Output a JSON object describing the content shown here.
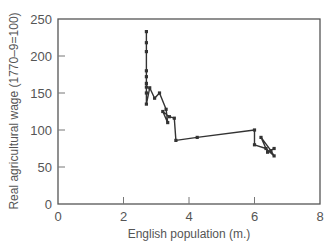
{
  "chart_data": {
    "type": "line",
    "title": "",
    "xlabel": "English population (m.)",
    "ylabel": "Real agricultural wage (1770–9=100)",
    "xlim": [
      0,
      8
    ],
    "ylim": [
      0,
      250
    ],
    "xticks": [
      0,
      2,
      4,
      6,
      8
    ],
    "yticks": [
      0,
      50,
      100,
      150,
      200,
      250
    ],
    "grid": false,
    "legend": null,
    "series": [
      {
        "name": "Wage vs population (time path)",
        "x": [
          2.7,
          2.7,
          2.7,
          2.7,
          2.7,
          2.7,
          2.7,
          2.7,
          2.7,
          2.8,
          2.95,
          3.1,
          3.3,
          3.35,
          3.2,
          3.4,
          3.55,
          3.6,
          4.25,
          6.0,
          6.0,
          6.35,
          6.6,
          6.5,
          6.2,
          6.4,
          6.6
        ],
        "y": [
          233,
          218,
          206,
          180,
          172,
          163,
          158,
          150,
          135,
          157,
          143,
          150,
          128,
          110,
          125,
          118,
          116,
          86,
          90,
          100,
          80,
          75,
          65,
          72,
          90,
          70,
          75
        ]
      }
    ]
  },
  "axes": {
    "x_title": "English population (m.)",
    "y_title": "Real agricultural wage (1770–9=100)",
    "x_tick_labels": [
      "0",
      "2",
      "4",
      "6",
      "8"
    ],
    "y_tick_labels": [
      "0",
      "50",
      "100",
      "150",
      "200",
      "250"
    ]
  }
}
